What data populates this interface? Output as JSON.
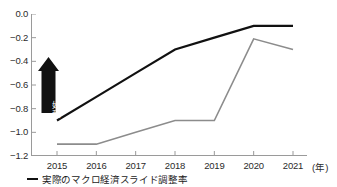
{
  "chart_data": {
    "type": "line",
    "title": "",
    "xlabel": "(年)",
    "ylabel": "",
    "categories": [
      "2015",
      "2016",
      "2017",
      "2018",
      "2019",
      "2020",
      "2021"
    ],
    "ylim": [
      -1.2,
      0.0
    ],
    "yticks": [
      "0.0",
      "-0.2",
      "-0.4",
      "-0.6",
      "-0.8",
      "-1.0",
      "-1.2"
    ],
    "ytick_values": [
      0.0,
      -0.2,
      -0.4,
      -0.6,
      -0.8,
      -1.0,
      -1.2
    ],
    "grid": false,
    "legend_position": "bottom-left",
    "series": [
      {
        "name": "実際のマクロ経済スライド調整率",
        "color": "#111111",
        "values": [
          -0.9,
          -0.7,
          -0.5,
          -0.3,
          -0.2,
          -0.1,
          -0.1
        ]
      },
      {
        "name": "",
        "color": "#8c8c8c",
        "values": [
          -1.1,
          -1.1,
          -1.0,
          -0.9,
          -0.9,
          -0.21,
          -0.3
        ]
      }
    ],
    "annotations": [
      {
        "name": "improvement-arrow",
        "text": "好転",
        "direction": "up",
        "color": "#111111",
        "text_color": "#ffffff"
      }
    ]
  },
  "axis": {
    "x_unit_label": "(年)"
  },
  "legend": {
    "items": [
      {
        "label": "実際のマクロ経済スライド調整率",
        "color": "#111111"
      }
    ]
  },
  "colors": {
    "series_primary": "#111111",
    "series_secondary": "#8c8c8c",
    "axis": "#9a9a9a",
    "text": "#2b2b2b"
  }
}
